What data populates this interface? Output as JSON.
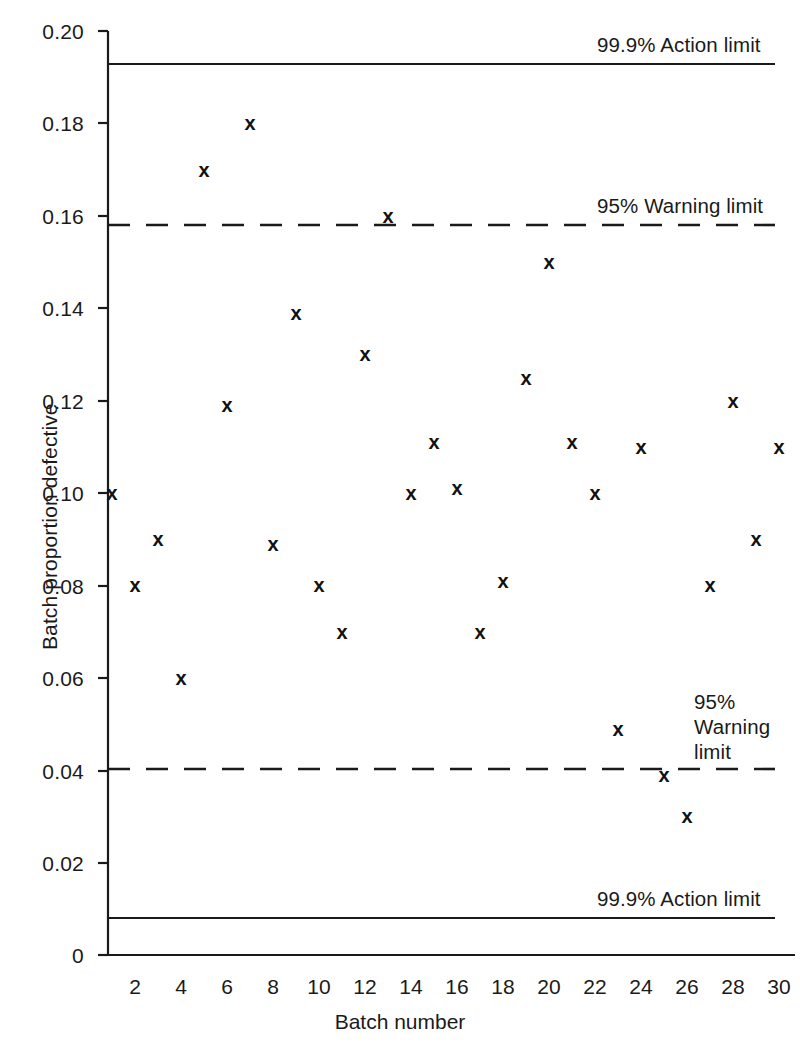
{
  "chart_data": {
    "type": "scatter",
    "title": "",
    "xlabel": "Batch number",
    "ylabel": "Batch proportion defective",
    "xlim": [
      0.5,
      30.5
    ],
    "ylim": [
      0,
      0.2
    ],
    "grid": false,
    "legend": "none",
    "marker": "x",
    "x": [
      1,
      2,
      3,
      4,
      5,
      6,
      7,
      8,
      9,
      10,
      11,
      12,
      13,
      14,
      15,
      16,
      17,
      18,
      19,
      20,
      21,
      22,
      23,
      24,
      25,
      26,
      27,
      28,
      29,
      30
    ],
    "values": [
      0.1,
      0.08,
      0.09,
      0.06,
      0.17,
      0.119,
      0.18,
      0.089,
      0.139,
      0.08,
      0.07,
      0.13,
      0.16,
      0.1,
      0.111,
      0.101,
      0.07,
      0.081,
      0.125,
      0.15,
      0.111,
      0.1,
      0.049,
      0.11,
      0.039,
      0.03,
      0.08,
      0.12,
      0.09,
      0.11
    ],
    "categories": [
      "1",
      "2",
      "3",
      "4",
      "5",
      "6",
      "7",
      "8",
      "9",
      "10",
      "11",
      "12",
      "13",
      "14",
      "15",
      "16",
      "17",
      "18",
      "19",
      "20",
      "21",
      "22",
      "23",
      "24",
      "25",
      "26",
      "27",
      "28",
      "29",
      "30"
    ],
    "xticks": [
      2,
      4,
      6,
      8,
      10,
      12,
      14,
      16,
      18,
      20,
      22,
      24,
      26,
      28,
      30
    ],
    "xtick_labels": [
      "2",
      "4",
      "6",
      "8",
      "10",
      "12",
      "14",
      "16",
      "18",
      "20",
      "22",
      "24",
      "26",
      "28",
      "30"
    ],
    "yticks": [
      0,
      0.02,
      0.04,
      0.06,
      0.08,
      0.1,
      0.12,
      0.14,
      0.16,
      0.18,
      0.2
    ],
    "ytick_labels": [
      "0",
      "0.02",
      "0.04",
      "0.06",
      "0.08",
      "0.10",
      "0.12",
      "0.14",
      "0.16",
      "0.18",
      "0.20"
    ],
    "reference_lines": [
      {
        "name": "upper-action-limit",
        "value": 0.1925,
        "style": "solid",
        "label": "99.9% Action limit"
      },
      {
        "name": "upper-warning-limit",
        "value": 0.16,
        "style": "dashed",
        "label": "95% Warning limit"
      },
      {
        "name": "lower-warning-limit",
        "value": 0.04,
        "style": "dashed",
        "label": "95% Warning limit"
      },
      {
        "name": "lower-action-limit",
        "value": 0.008,
        "style": "solid",
        "label": "99.9% Action limit"
      }
    ],
    "colors": {
      "axis": "#1a1a1a",
      "marker": "#111111",
      "limit_line": "#1a1a1a",
      "background": "#ffffff"
    }
  },
  "axes": {
    "y_title": "Batch proportion defective",
    "x_title": "Batch number",
    "y_labels": [
      "0.20",
      "0.18",
      "0.16",
      "0.14",
      "0.12",
      "0.10",
      "0.08",
      "0.06",
      "0.04",
      "0.02",
      "0"
    ],
    "x_labels": [
      "2",
      "4",
      "6",
      "8",
      "10",
      "12",
      "14",
      "16",
      "18",
      "20",
      "22",
      "24",
      "26",
      "28",
      "30"
    ]
  },
  "annotations": {
    "upper_action": "99.9% Action limit",
    "upper_warning": "95% Warning limit",
    "lower_warning_line1": "95%",
    "lower_warning_line2": "Warning",
    "lower_warning_line3": "limit",
    "lower_action": "99.9% Action limit"
  }
}
